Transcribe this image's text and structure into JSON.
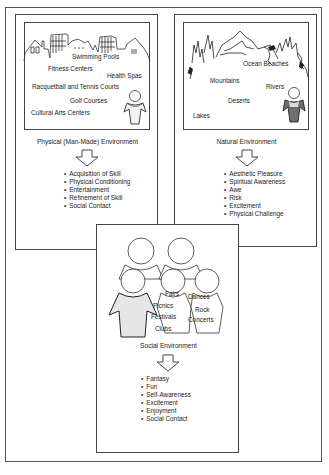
{
  "panels": {
    "physical": {
      "title": "Physical (Man-Made) Environment",
      "places": [
        "Swimming Pools",
        "Fitness Centers",
        "Health Spas",
        "Racquetball and Tennis Courts",
        "Golf Courses",
        "Cultural Arts Centers"
      ],
      "benefits": [
        "Acquisition of Skill",
        "Physical Conditioning",
        "Entertainment",
        "Refinement of Skill",
        "Social Contact"
      ]
    },
    "natural": {
      "title": "Natural Environment",
      "places": [
        "Ocean Beaches",
        "Mountains",
        "Rivers",
        "Deserts",
        "Lakes"
      ],
      "benefits": [
        "Aesthetic Pleasure",
        "Spiritual Awareness",
        "Awe",
        "Risk",
        "Excitement",
        "Physical Challenge"
      ]
    },
    "social": {
      "title": "Social Environment",
      "activities": [
        "Fairs",
        "Picnics",
        "Festivals",
        "Clubs",
        "Dances",
        "Rock",
        "Concerts"
      ],
      "benefits": [
        "Fantasy",
        "Fun",
        "Self-Awareness",
        "Excitement",
        "Enjoyment",
        "Social Contact"
      ]
    }
  },
  "icons": {
    "arrow": "down-arrow",
    "person": "person-figure",
    "skyline": "buildings-skyline",
    "mountains": "mountains-trees",
    "crowd": "group-of-people"
  },
  "colors": {
    "line": "#444444",
    "figure_fill": "#e6e6e6"
  }
}
